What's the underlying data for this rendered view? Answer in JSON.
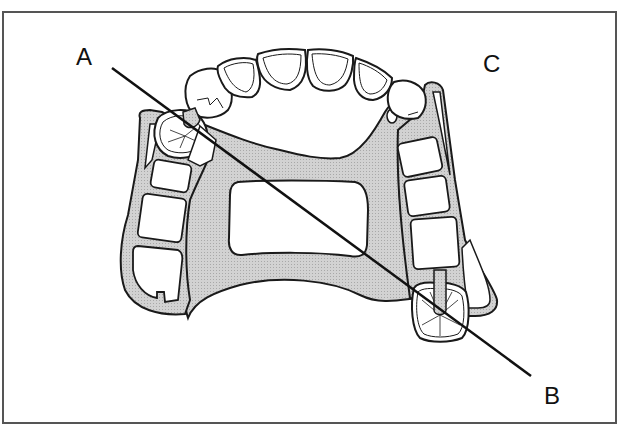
{
  "figure": {
    "type": "dental diagram",
    "labels": {
      "a": "A",
      "b": "B",
      "c": "C"
    },
    "line": {
      "from_label": "A",
      "to_label": "B",
      "description": "fulcrum line between rest-bearing abutment teeth"
    },
    "colors": {
      "framework_fill": "#c8c8c8",
      "outline": "#1a1a1a",
      "tooth_fill": "#ffffff",
      "border": "#555555"
    }
  }
}
